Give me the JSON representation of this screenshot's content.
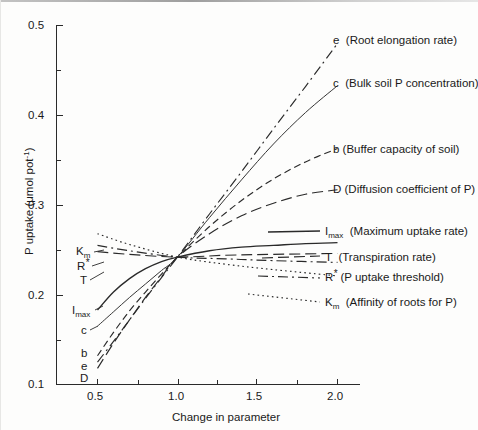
{
  "figure": {
    "background_color": "#fdfdfc",
    "ink_color": "#1a1a1a"
  },
  "chart_data": {
    "type": "line",
    "title": "",
    "xlabel": "Change in parameter",
    "ylabel": "P uptake (μmol pot⁻¹)",
    "xlim": [
      0.35,
      2.15
    ],
    "ylim": [
      0.1,
      0.5
    ],
    "xticks": [
      0.5,
      1.0,
      1.5,
      2.0
    ],
    "xtick_labels": [
      "0.5",
      "1.0",
      "1.5",
      "2.0"
    ],
    "xticks_minor": [
      0.75,
      1.25,
      1.75
    ],
    "yticks": [
      0.1,
      0.2,
      0.3,
      0.4,
      0.5
    ],
    "ytick_labels": [
      "0.1",
      "0.2",
      "0.3",
      "0.4",
      "0.5"
    ],
    "yticks_minor": [
      0.15,
      0.25,
      0.35,
      0.45
    ],
    "grid": false,
    "legend_position": "inline-right",
    "convergence_point": {
      "x": 1.0,
      "y": 0.242
    },
    "series": [
      {
        "key": "e",
        "symbol": "e",
        "description": "Root elongation rate",
        "legend_label": "e  (Root elongation rate)",
        "left_tag": "e",
        "line_style": "dashdot",
        "x": [
          0.5,
          0.6,
          0.7,
          0.8,
          0.9,
          1.0,
          1.2,
          1.4,
          1.6,
          1.8,
          2.0
        ],
        "y": [
          0.125,
          0.148,
          0.172,
          0.196,
          0.219,
          0.242,
          0.29,
          0.337,
          0.385,
          0.432,
          0.48
        ]
      },
      {
        "key": "c",
        "symbol": "c",
        "description": "Bulk soil P concentration",
        "legend_label": "c  (Bulk soil P concentration)",
        "left_tag": "c",
        "line_style": "solid-thin",
        "x": [
          0.5,
          0.6,
          0.7,
          0.8,
          0.9,
          1.0,
          1.2,
          1.4,
          1.6,
          1.8,
          2.0
        ],
        "y": [
          0.165,
          0.181,
          0.197,
          0.212,
          0.227,
          0.242,
          0.286,
          0.328,
          0.368,
          0.403,
          0.433
        ]
      },
      {
        "key": "b",
        "symbol": "b",
        "description": "Buffer capacity of soil",
        "legend_label": "b (Buffer capacity of soil)",
        "left_tag": "b",
        "line_style": "dashed",
        "x": [
          0.5,
          0.6,
          0.7,
          0.8,
          0.9,
          1.0,
          1.2,
          1.4,
          1.6,
          1.8,
          2.0
        ],
        "y": [
          0.132,
          0.158,
          0.182,
          0.203,
          0.223,
          0.242,
          0.276,
          0.305,
          0.329,
          0.348,
          0.363
        ]
      },
      {
        "key": "D",
        "symbol": "D",
        "description": "Diffusion coefficient of P",
        "legend_label": "D (Diffusion coefficient of P)",
        "left_tag": "D",
        "line_style": "longdash",
        "x": [
          0.5,
          0.6,
          0.7,
          0.8,
          0.9,
          1.0,
          1.2,
          1.4,
          1.6,
          1.8,
          2.0
        ],
        "y": [
          0.118,
          0.146,
          0.172,
          0.197,
          0.22,
          0.242,
          0.268,
          0.288,
          0.302,
          0.312,
          0.317
        ]
      },
      {
        "key": "Imax",
        "symbol": "I_max",
        "description": "Maximum uptake rate",
        "legend_label": "I_max  (Maximum uptake rate)",
        "left_tag": "I_max",
        "line_style": "solid",
        "x": [
          0.5,
          0.6,
          0.7,
          0.8,
          0.9,
          1.0,
          1.2,
          1.4,
          1.6,
          1.8,
          2.0
        ],
        "y": [
          0.183,
          0.203,
          0.218,
          0.229,
          0.237,
          0.242,
          0.249,
          0.253,
          0.255,
          0.257,
          0.258
        ]
      },
      {
        "key": "T",
        "symbol": "T",
        "description": "Transpiration rate",
        "legend_label": "T  (Transpiration rate)",
        "left_tag": "T",
        "line_style": "longdash",
        "x": [
          0.5,
          0.7,
          1.0,
          1.3,
          1.6,
          2.0
        ],
        "y": [
          0.248,
          0.245,
          0.242,
          0.244,
          0.245,
          0.246
        ]
      },
      {
        "key": "Rstar",
        "symbol": "R*",
        "description": "P uptake threshold",
        "legend_label": "R* (P uptake threshold)",
        "left_tag": "R*",
        "line_style": "dashdot",
        "x": [
          0.5,
          0.7,
          1.0,
          1.3,
          1.6,
          2.0
        ],
        "y": [
          0.255,
          0.249,
          0.242,
          0.24,
          0.238,
          0.236
        ]
      },
      {
        "key": "Km",
        "symbol": "K_m",
        "description": "Affinity of roots for P",
        "legend_label": "K_m  (Affinity of roots for P)",
        "left_tag": "K_m",
        "line_style": "dotted",
        "x": [
          0.5,
          0.7,
          1.0,
          1.3,
          1.6,
          2.0
        ],
        "y": [
          0.268,
          0.256,
          0.242,
          0.234,
          0.228,
          0.221
        ]
      }
    ]
  },
  "legend_right": {
    "entries": [
      {
        "symbol": "e",
        "sub": "",
        "star": false,
        "text": "(Root elongation rate)"
      },
      {
        "symbol": "c",
        "sub": "",
        "star": false,
        "text": "(Bulk soil P concentration)"
      },
      {
        "symbol": "b",
        "sub": "",
        "star": false,
        "text": "(Buffer capacity of soil)"
      },
      {
        "symbol": "D",
        "sub": "",
        "star": false,
        "text": "(Diffusion coefficient of P)"
      },
      {
        "symbol": "I",
        "sub": "max",
        "star": false,
        "text": "(Maximum uptake rate)"
      },
      {
        "symbol": "T",
        "sub": "",
        "star": false,
        "text": "(Transpiration rate)"
      },
      {
        "symbol": "R",
        "sub": "",
        "star": true,
        "text": "(P uptake threshold)"
      },
      {
        "symbol": "K",
        "sub": "m",
        "star": false,
        "text": "(Affinity of roots for P)"
      }
    ]
  },
  "left_tags": {
    "items": [
      {
        "symbol": "K",
        "sub": "m",
        "star": false
      },
      {
        "symbol": "R",
        "sub": "",
        "star": true
      },
      {
        "symbol": "T",
        "sub": "",
        "star": false
      },
      {
        "symbol": "I",
        "sub": "max",
        "star": false
      },
      {
        "symbol": "c",
        "sub": "",
        "star": false
      },
      {
        "symbol": "b",
        "sub": "",
        "star": false
      },
      {
        "symbol": "e",
        "sub": "",
        "star": false
      },
      {
        "symbol": "D",
        "sub": "",
        "star": false
      }
    ]
  },
  "axes": {
    "x_title": "Change in parameter",
    "y_title_prefix": "P uptake (μmol pot",
    "y_title_exponent": "-1",
    "y_title_suffix": ")",
    "x_tick_labels": [
      "0.5",
      "1.0",
      "1.5",
      "2.0"
    ],
    "y_tick_labels": [
      "0.1",
      "0.2",
      "0.3",
      "0.4",
      "0.5"
    ]
  }
}
